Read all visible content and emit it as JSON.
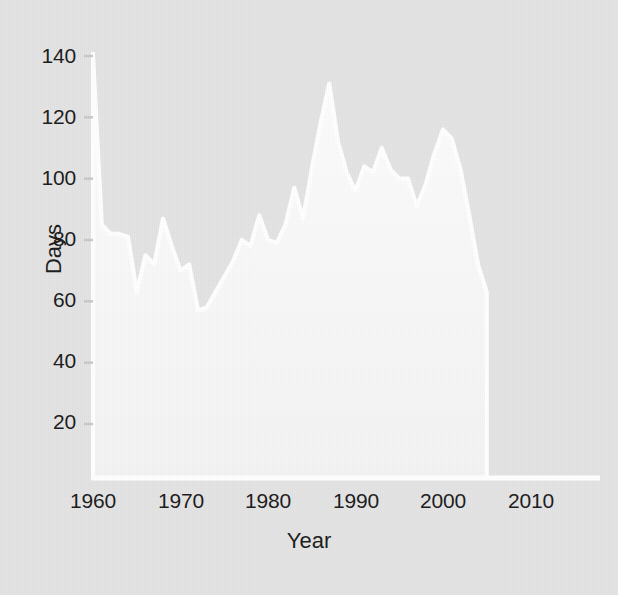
{
  "chart_data": {
    "type": "area",
    "title": "",
    "xlabel": "Year",
    "ylabel": "Days",
    "xlim": [
      1960,
      2010
    ],
    "ylim": [
      0,
      140
    ],
    "grid": false,
    "legend": "none",
    "xticks": [
      "1960",
      "1970",
      "1980",
      "1990",
      "2000",
      "2010"
    ],
    "xtick_values": [
      1960,
      1970,
      1980,
      1990,
      2000,
      2010
    ],
    "yticks": [
      "20",
      "40",
      "60",
      "80",
      "100",
      "120",
      "140"
    ],
    "ytick_values": [
      20,
      40,
      60,
      80,
      100,
      120,
      140
    ],
    "series_name": "Days",
    "x": [
      1960,
      1961,
      1962,
      1963,
      1964,
      1965,
      1966,
      1967,
      1968,
      1969,
      1970,
      1971,
      1972,
      1973,
      1974,
      1975,
      1976,
      1977,
      1978,
      1979,
      1980,
      1981,
      1982,
      1983,
      1984,
      1985,
      1986,
      1987,
      1988,
      1989,
      1990,
      1991,
      1992,
      1993,
      1994,
      1995,
      1996,
      1997,
      1998,
      1999,
      2000,
      2001,
      2002,
      2003,
      2004,
      2005
    ],
    "values": [
      140,
      85,
      82,
      82,
      81,
      63,
      75,
      72,
      87,
      78,
      70,
      72,
      57,
      58,
      63,
      68,
      73,
      80,
      78,
      88,
      80,
      79,
      85,
      97,
      87,
      103,
      118,
      131,
      112,
      102,
      96,
      104,
      102,
      110,
      103,
      100,
      100,
      91,
      98,
      108,
      116,
      113,
      103,
      88,
      72,
      63
    ],
    "notes": {
      "first_point": "series begins at the 140 axis top in 1960 then drops to ~85",
      "maximum": {
        "year": 1987,
        "value": 131
      },
      "secondary_peak": {
        "year": 2000,
        "value": 116
      },
      "minimum": {
        "year": 1972,
        "value": 57
      },
      "series_end": {
        "year": 2005,
        "value": 63
      }
    }
  },
  "axis": {
    "y_title": "Days",
    "x_title": "Year"
  },
  "colors": {
    "background": "#e4e4e4",
    "area_fill": "#f7f7f7",
    "line": "#ffffff",
    "axis": "#ffffff",
    "text": "#1b1b1b"
  }
}
